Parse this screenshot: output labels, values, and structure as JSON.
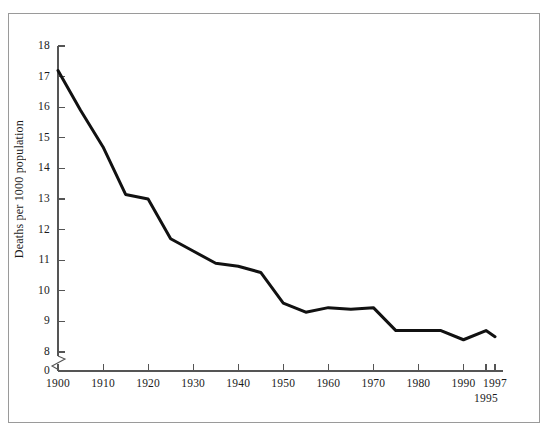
{
  "figure": {
    "border_color": "#9a9a9a",
    "background": "#ffffff"
  },
  "chart_data": {
    "type": "line",
    "title": "",
    "subtitle": "",
    "xlabel": "",
    "ylabel": "Deaths per 1000 population",
    "xlim": [
      1900,
      1997
    ],
    "ylim": [
      8,
      18
    ],
    "grid": false,
    "legend": null,
    "legend_position": "none",
    "y_axis_break": true,
    "y_axis_break_note": "axis broken between 0 and 8",
    "xtick_labels": [
      "1900",
      "1910",
      "1920",
      "1930",
      "1940",
      "1950",
      "1960",
      "1970",
      "1980",
      "1990",
      "1997"
    ],
    "xtick_values": [
      1900,
      1910,
      1920,
      1930,
      1940,
      1950,
      1960,
      1970,
      1980,
      1990,
      1997
    ],
    "xtick_extra_labels": [
      {
        "label": "1995",
        "value": 1995
      }
    ],
    "ytick_labels": [
      "18",
      "17",
      "16",
      "15",
      "14",
      "13",
      "12",
      "11",
      "10",
      "9",
      "8",
      "0"
    ],
    "ytick_values": [
      18,
      17,
      16,
      15,
      14,
      13,
      12,
      11,
      10,
      9,
      8,
      0
    ],
    "series": [
      {
        "name": "Death rate",
        "color": "#111111",
        "line_width": 3,
        "x": [
          1900,
          1905,
          1910,
          1915,
          1920,
          1925,
          1930,
          1935,
          1940,
          1945,
          1950,
          1955,
          1960,
          1965,
          1970,
          1975,
          1980,
          1985,
          1990,
          1995,
          1997
        ],
        "y": [
          17.2,
          15.9,
          14.7,
          13.15,
          13.0,
          11.7,
          11.3,
          10.9,
          10.8,
          10.6,
          9.6,
          9.3,
          9.45,
          9.4,
          9.45,
          8.7,
          8.7,
          8.7,
          8.4,
          8.7,
          8.5
        ]
      }
    ]
  }
}
